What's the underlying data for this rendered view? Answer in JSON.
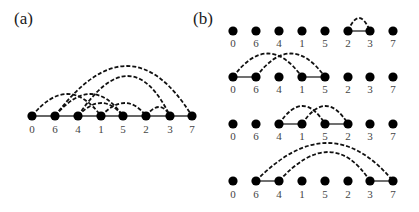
{
  "figure": {
    "panel_a": {
      "label": "(a)",
      "order": [
        "0",
        "6",
        "4",
        "1",
        "5",
        "2",
        "3",
        "7"
      ],
      "solid_edges": "baseline path through all nodes",
      "arcs": [
        {
          "from": "6",
          "to": "7"
        },
        {
          "from": "4",
          "to": "3"
        },
        {
          "from": "0",
          "to": "1"
        },
        {
          "from": "6",
          "to": "5"
        },
        {
          "from": "1",
          "to": "2"
        },
        {
          "from": "4",
          "to": "5"
        },
        {
          "from": "2",
          "to": "3"
        }
      ]
    },
    "panel_b": {
      "label": "(b)",
      "rows": [
        {
          "order": [
            "0",
            "6",
            "4",
            "1",
            "5",
            "2",
            "3",
            "7"
          ],
          "solid_edges": [
            [
              "2",
              "3"
            ]
          ],
          "arcs": [
            [
              "2",
              "3"
            ]
          ]
        },
        {
          "order": [
            "0",
            "6",
            "4",
            "1",
            "5",
            "2",
            "3",
            "7"
          ],
          "solid_edges": [
            [
              "0",
              "6"
            ],
            [
              "1",
              "5"
            ]
          ],
          "arcs": [
            [
              "0",
              "1"
            ],
            [
              "6",
              "5"
            ]
          ]
        },
        {
          "order": [
            "0",
            "6",
            "4",
            "1",
            "5",
            "2",
            "3",
            "7"
          ],
          "solid_edges": [
            [
              "4",
              "1"
            ],
            [
              "5",
              "2"
            ]
          ],
          "arcs": [
            [
              "4",
              "5"
            ],
            [
              "1",
              "2"
            ]
          ]
        },
        {
          "order": [
            "0",
            "6",
            "4",
            "1",
            "5",
            "2",
            "3",
            "7"
          ],
          "solid_edges": [
            [
              "6",
              "4"
            ],
            [
              "3",
              "7"
            ]
          ],
          "arcs": [
            [
              "6",
              "7"
            ],
            [
              "4",
              "3"
            ]
          ]
        }
      ]
    }
  },
  "colors": {
    "node": "#000000",
    "edge": "#333333",
    "label": "#444444",
    "background": "#ffffff"
  }
}
